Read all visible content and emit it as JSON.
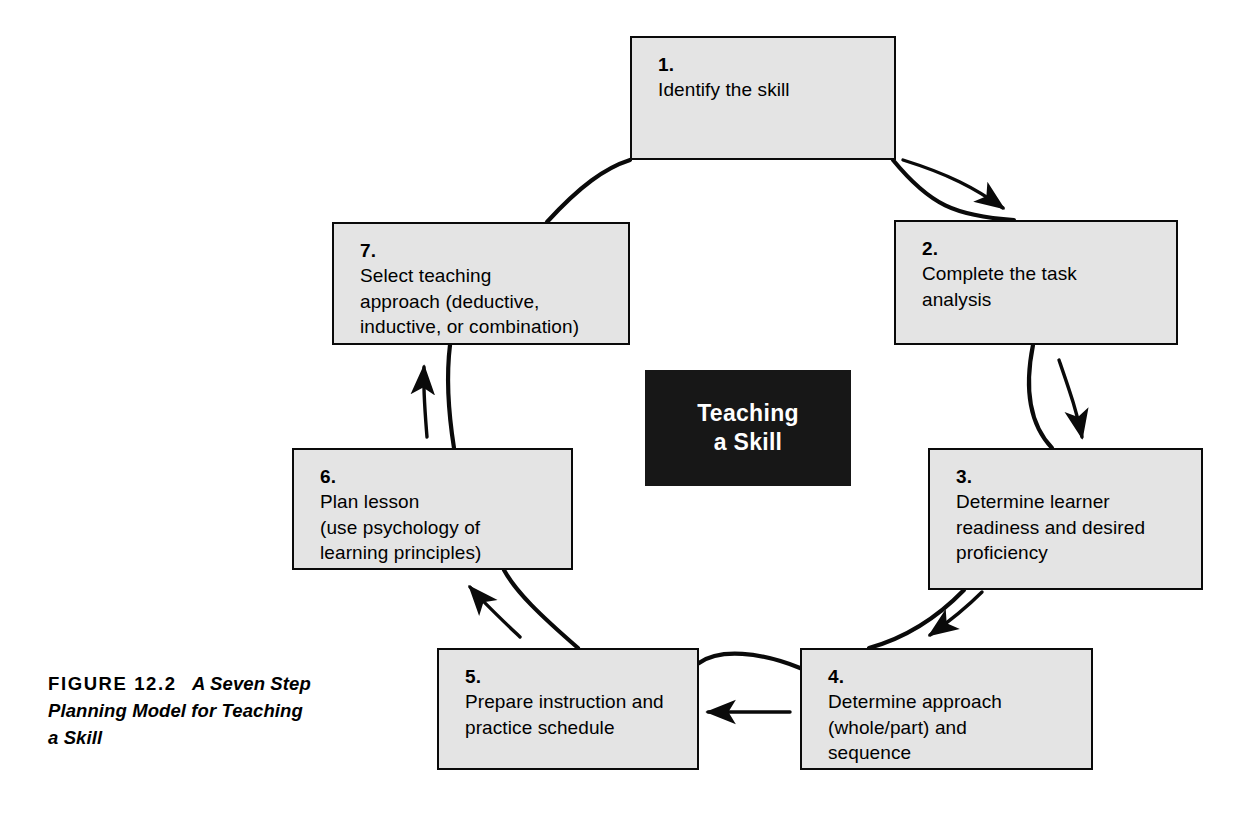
{
  "figure": {
    "label": "FIGURE 12.2",
    "title": "A Seven Step Planning Model for Teaching a Skill"
  },
  "hub": {
    "line1": "Teaching",
    "line2": "a Skill",
    "background": "#171717",
    "text_color": "#ffffff"
  },
  "diagram": {
    "type": "cycle",
    "fill": "#e4e4e4",
    "stroke": "#0a0a0a",
    "step_count": 7,
    "steps": [
      {
        "number": "1.",
        "text": "Identify the skill"
      },
      {
        "number": "2.",
        "text": "Complete the task\nanalysis"
      },
      {
        "number": "3.",
        "text": "Determine learner\nreadiness and desired\nproficiency"
      },
      {
        "number": "4.",
        "text": "Determine approach\n(whole/part) and\nsequence"
      },
      {
        "number": "5.",
        "text": "Prepare instruction and\npractice schedule"
      },
      {
        "number": "6.",
        "text": "Plan lesson\n(use psychology of\nlearning principles)"
      },
      {
        "number": "7.",
        "text": "Select teaching\napproach (deductive,\ninductive, or combination)"
      }
    ],
    "flow": [
      {
        "from": "1",
        "to": "2"
      },
      {
        "from": "2",
        "to": "3"
      },
      {
        "from": "3",
        "to": "4"
      },
      {
        "from": "4",
        "to": "5"
      },
      {
        "from": "5",
        "to": "6"
      },
      {
        "from": "6",
        "to": "7"
      },
      {
        "from": "7",
        "to": "1"
      }
    ]
  }
}
